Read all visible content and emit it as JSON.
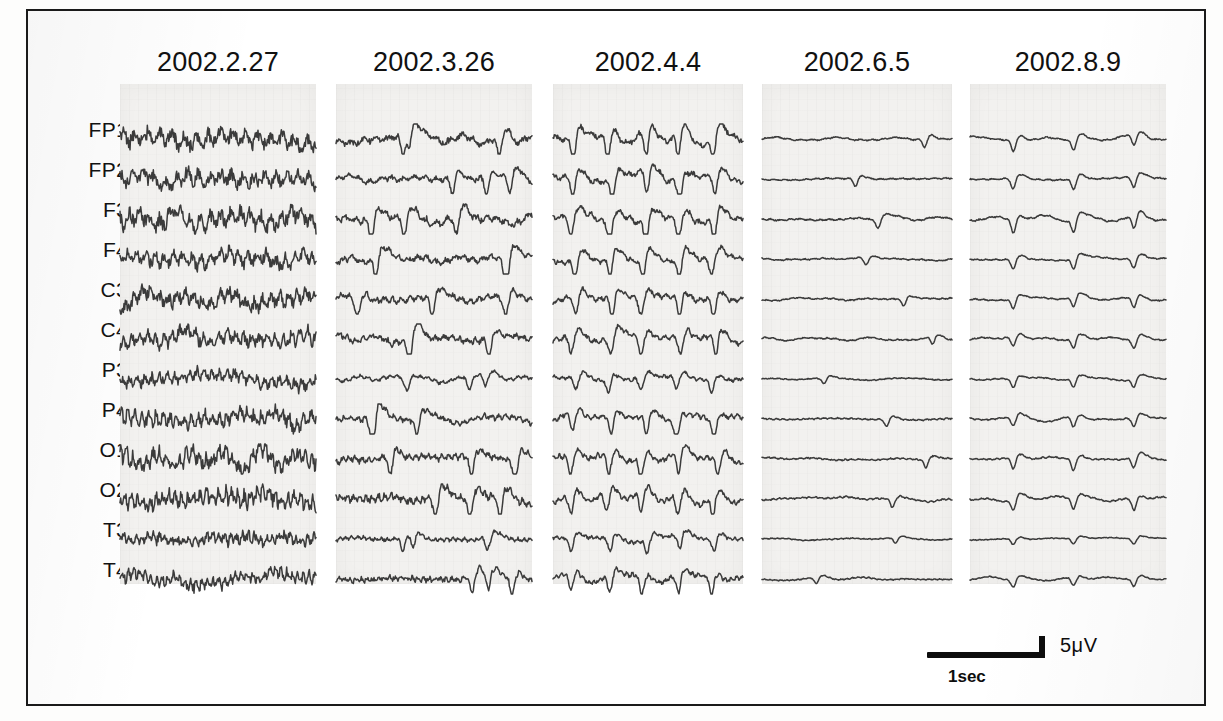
{
  "figure": {
    "frame_color": "#1a1a1a",
    "trace_color": "#2b2b2b",
    "paper_color": "#f2f1ef"
  },
  "channels": [
    {
      "label": "FP1"
    },
    {
      "label": "FP2"
    },
    {
      "label": "F3"
    },
    {
      "label": "F4"
    },
    {
      "label": "C3"
    },
    {
      "label": "C4"
    },
    {
      "label": "P3"
    },
    {
      "label": "P4"
    },
    {
      "label": "O1"
    },
    {
      "label": "O2"
    },
    {
      "label": "T3"
    },
    {
      "label": "T4"
    }
  ],
  "columns": [
    {
      "date": "2002.2.27",
      "x": 118,
      "width": 196,
      "header_center": 216
    },
    {
      "date": "2002.3.26",
      "x": 334,
      "width": 196,
      "header_center": 432
    },
    {
      "date": "2002.4.4",
      "x": 551,
      "width": 190,
      "header_center": 646
    },
    {
      "date": "2002.6.5",
      "x": 760,
      "width": 190,
      "header_center": 855
    },
    {
      "date": "2002.8.9",
      "x": 968,
      "width": 196,
      "header_center": 1066
    }
  ],
  "scale_bar": {
    "amplitude_label": "5μV",
    "time_label": "1sec",
    "hline_x": 925,
    "hline_y": 650,
    "hline_width": 118,
    "vtick_x": 1037,
    "vtick_y": 634,
    "vtick_height": 22,
    "amp_label_x": 1058,
    "amp_label_y": 632,
    "time_label_x": 946,
    "time_label_y": 665
  },
  "chart_data": {
    "type": "line",
    "xlabel": "Time (1 sec scale bar shown)",
    "ylabel": "Amplitude (5 μV scale bar shown)",
    "grid": false,
    "legend": "none",
    "row_spacing_px": 40,
    "first_row_y_px": 128,
    "channels": [
      "FP1",
      "FP2",
      "F3",
      "F4",
      "C3",
      "C4",
      "P3",
      "P4",
      "O1",
      "O2",
      "T3",
      "T4"
    ],
    "dates": [
      "2002.2.27",
      "2002.3.26",
      "2002.4.4",
      "2002.6.5",
      "2002.8.9"
    ],
    "scale": {
      "time": "1 sec",
      "amplitude": "5 μV"
    },
    "series": [
      {
        "name": "2002.2.27",
        "description": "High-amplitude continuous irregular slow and theta activity across all leads; no periodic complexes.",
        "amplitude_relative": 1.0,
        "rhythm": "irregular-slow",
        "periodic_complexes": false,
        "spikes_per_epoch": 0,
        "noise_level": 0.95,
        "channel_amplitudes": [
          1.0,
          0.92,
          1.0,
          0.86,
          0.88,
          0.84,
          0.7,
          0.88,
          0.92,
          0.94,
          0.66,
          0.66
        ]
      },
      {
        "name": "2002.3.26",
        "description": "Reduced background amplitude with emerging intermittent sharp transients.",
        "amplitude_relative": 0.62,
        "rhythm": "mixed-slow-sharp",
        "periodic_complexes": false,
        "spikes_per_epoch": 3,
        "noise_level": 0.55,
        "channel_amplitudes": [
          0.7,
          0.52,
          0.72,
          0.58,
          0.6,
          0.58,
          0.34,
          0.52,
          0.62,
          0.74,
          0.4,
          0.52
        ]
      },
      {
        "name": "2002.4.4",
        "description": "Moderate amplitude with quasi-periodic sharp-wave complexes appearing in most leads.",
        "amplitude_relative": 0.66,
        "rhythm": "quasi-periodic",
        "periodic_complexes": true,
        "spikes_per_epoch": 5,
        "noise_level": 0.45,
        "channel_amplitudes": [
          0.72,
          0.66,
          0.7,
          0.6,
          0.62,
          0.6,
          0.4,
          0.56,
          0.62,
          0.62,
          0.42,
          0.52
        ]
      },
      {
        "name": "2002.6.5",
        "description": "Marked diffuse attenuation; low-voltage flattened background with rare low sharp transients.",
        "amplitude_relative": 0.26,
        "rhythm": "attenuated-flat",
        "periodic_complexes": false,
        "spikes_per_epoch": 1,
        "noise_level": 0.3,
        "channel_amplitudes": [
          0.26,
          0.24,
          0.3,
          0.22,
          0.22,
          0.22,
          0.18,
          0.24,
          0.26,
          0.26,
          0.16,
          0.2
        ]
      },
      {
        "name": "2002.8.9",
        "description": "Flat low-voltage background interrupted by regular periodic sharp-wave complexes (~3 per epoch).",
        "amplitude_relative": 0.3,
        "rhythm": "periodic-spikes",
        "periodic_complexes": true,
        "spikes_per_epoch": 3,
        "noise_level": 0.22,
        "channel_amplitudes": [
          0.36,
          0.34,
          0.4,
          0.32,
          0.3,
          0.3,
          0.26,
          0.3,
          0.34,
          0.34,
          0.18,
          0.24
        ]
      }
    ]
  }
}
